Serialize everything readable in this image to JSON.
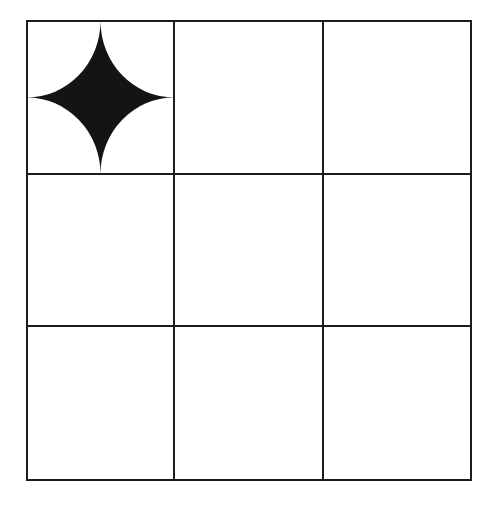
{
  "diagram": {
    "type": "grid",
    "rows": 3,
    "cols": 3,
    "background": "#ffffff",
    "line_color": "#1c1c1c",
    "line_width": 2,
    "col_lines": [
      27,
      174,
      323,
      471
    ],
    "row_lines": [
      21,
      174,
      326,
      480
    ],
    "cells": [
      {
        "row": 0,
        "col": 0,
        "content": "four-point-star",
        "fill": "#141414"
      },
      {
        "row": 0,
        "col": 1,
        "content": "empty"
      },
      {
        "row": 0,
        "col": 2,
        "content": "empty"
      },
      {
        "row": 1,
        "col": 0,
        "content": "empty"
      },
      {
        "row": 1,
        "col": 1,
        "content": "empty"
      },
      {
        "row": 1,
        "col": 2,
        "content": "empty"
      },
      {
        "row": 2,
        "col": 0,
        "content": "empty"
      },
      {
        "row": 2,
        "col": 1,
        "content": "empty"
      },
      {
        "row": 2,
        "col": 2,
        "content": "empty"
      }
    ]
  }
}
